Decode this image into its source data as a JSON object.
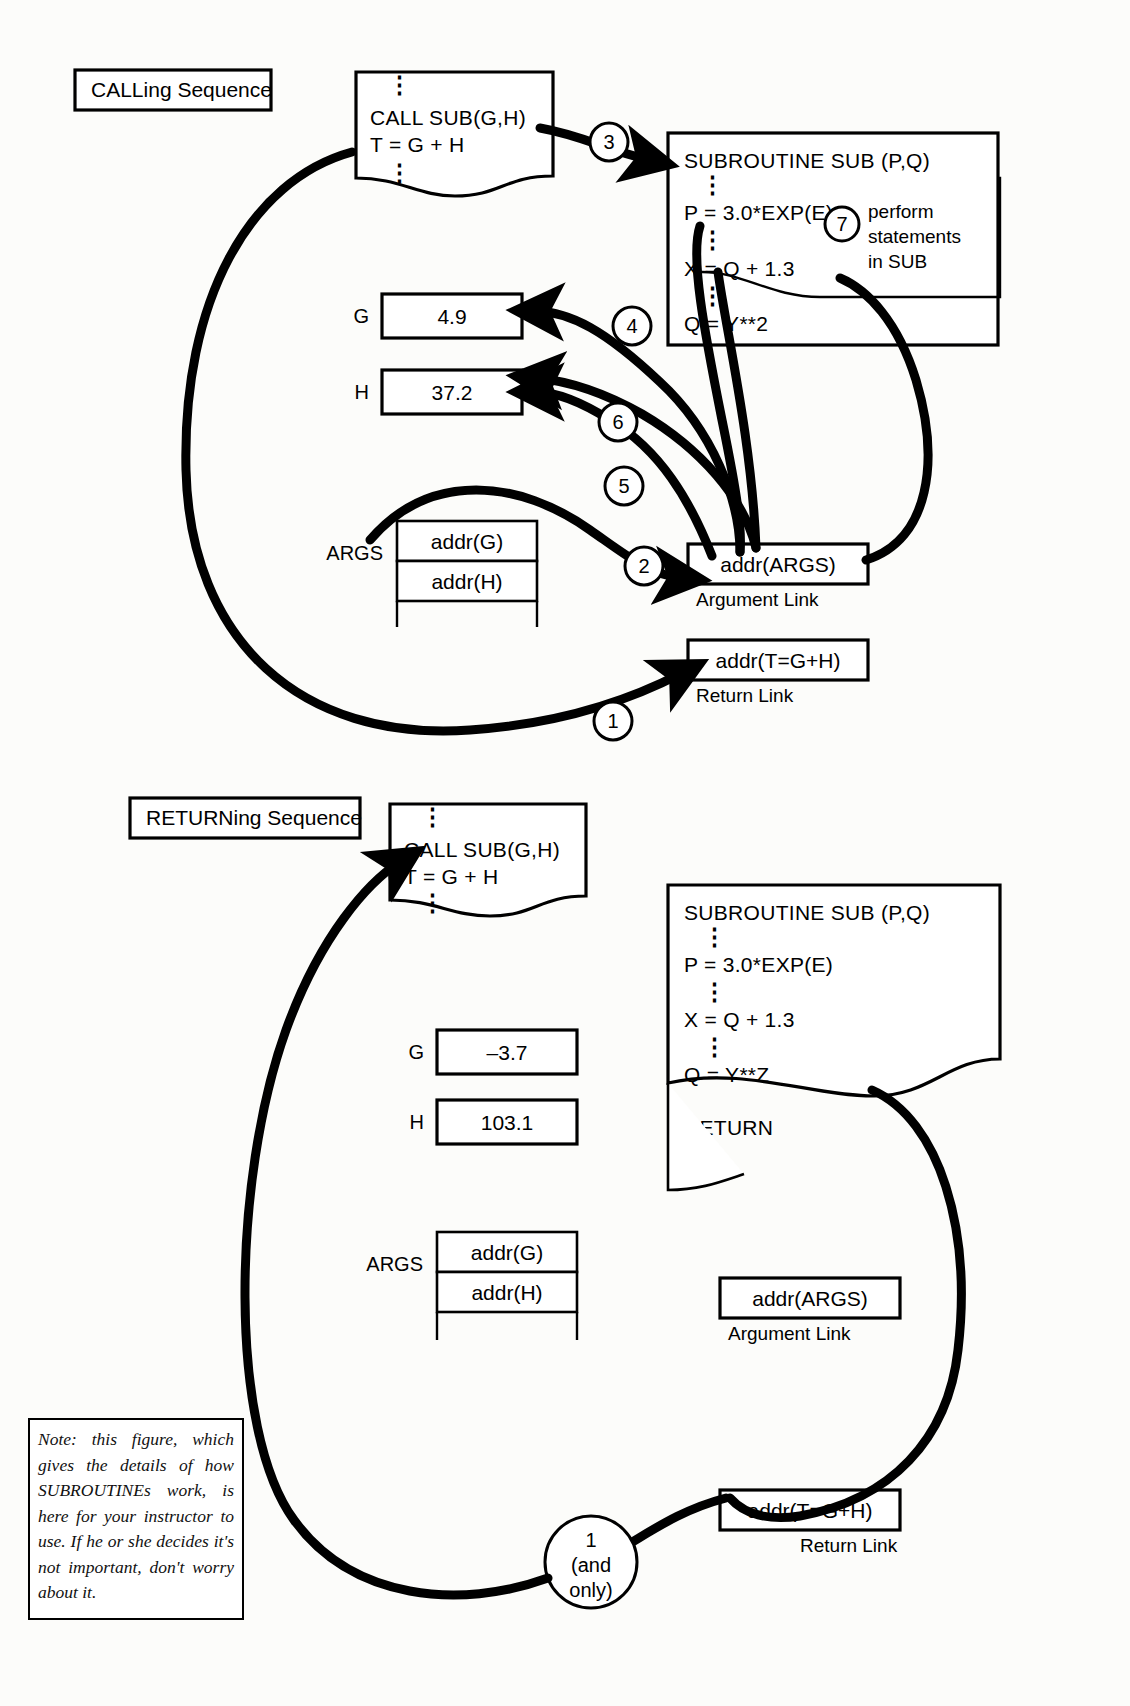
{
  "figure": {
    "caption": ""
  },
  "calling": {
    "header": "CALLing Sequence",
    "main_program": {
      "lines": [
        "CALL SUB(G,H)",
        "T = G + H"
      ]
    },
    "subroutine": {
      "title": "SUBROUTINE SUB (P,Q)",
      "lines": [
        "P = 3.0*EXP(E)",
        "X = Q + 1.3",
        "Q = Y**2"
      ]
    },
    "annotation": {
      "step": "7",
      "line1": "perform",
      "line2": "statements",
      "line3": "in SUB"
    },
    "variables": [
      {
        "name": "G",
        "value": "4.9"
      },
      {
        "name": "H",
        "value": "37.2"
      }
    ],
    "args": {
      "label": "ARGS",
      "rows": [
        "addr(G)",
        "addr(H)"
      ]
    },
    "argument_link": {
      "value": "addr(ARGS)",
      "label": "Argument Link"
    },
    "return_link": {
      "value": "addr(T=G+H)",
      "label": "Return Link"
    },
    "steps": [
      "1",
      "2",
      "3",
      "4",
      "5",
      "6"
    ]
  },
  "returning": {
    "header": "RETURNing Sequence",
    "main_program": {
      "lines": [
        "CALL SUB(G,H)",
        "T = G + H"
      ]
    },
    "subroutine": {
      "title": "SUBROUTINE SUB (P,Q)",
      "lines": [
        "P = 3.0*EXP(E)",
        "X = Q + 1.3",
        "Q = Y**Z",
        "RETURN"
      ]
    },
    "variables": [
      {
        "name": "G",
        "value": "–3.7"
      },
      {
        "name": "H",
        "value": "103.1"
      }
    ],
    "args": {
      "label": "ARGS",
      "rows": [
        "addr(G)",
        "addr(H)"
      ]
    },
    "argument_link": {
      "value": "addr(ARGS)",
      "label": "Argument Link"
    },
    "return_link": {
      "value": "addr(T=G+H)",
      "label": "Return Link"
    },
    "step": {
      "num": "1",
      "line2": "(and",
      "line3": "only)"
    }
  },
  "note": {
    "text": "Note: this figure, which gives the details of how SUBROUTINEs work, is here for your instructor to use. If he or she decides it's not important, don't worry about it."
  },
  "colors": {
    "ink": "#000000",
    "paper": "#fcfcfa"
  }
}
